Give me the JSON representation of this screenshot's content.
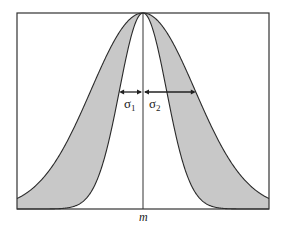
{
  "figure": {
    "mean_label": "m",
    "sigma1": {
      "symbol": "σ",
      "subscript": "1"
    },
    "sigma2": {
      "symbol": "σ",
      "subscript": "2"
    },
    "colors": {
      "fill": "#c8c8c8",
      "stroke": "#2a2a2a",
      "frame": "#333333",
      "background": "#ffffff"
    }
  },
  "geometry": {
    "frame": {
      "x0": 17,
      "y0": 13,
      "x1": 269,
      "y1": 209
    },
    "mean_x": 143,
    "peak_y": 13,
    "base_y": 209,
    "sigma1_px": 23.5,
    "sigma2_px": 52,
    "arrow_y": 92
  }
}
